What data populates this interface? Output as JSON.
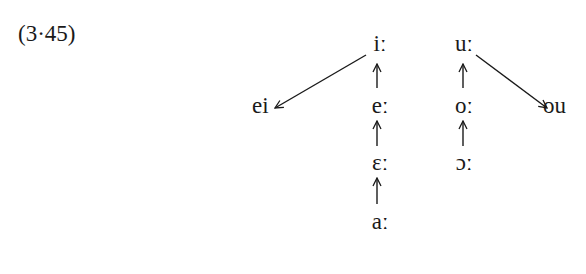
{
  "example_number": "(3·45)",
  "columns": {
    "front": [
      {
        "id": "i_long",
        "symbol": "iː"
      },
      {
        "id": "e_long",
        "symbol": "eː"
      },
      {
        "id": "open_e_long",
        "symbol": "ɛː"
      },
      {
        "id": "a_long",
        "symbol": "aː"
      }
    ],
    "back": [
      {
        "id": "u_long",
        "symbol": "uː"
      },
      {
        "id": "o_long",
        "symbol": "oː"
      },
      {
        "id": "open_o_long",
        "symbol": "ɔː"
      }
    ]
  },
  "diphthongs": {
    "front": {
      "id": "ei",
      "symbol": "ei"
    },
    "back": {
      "id": "ou",
      "symbol": "ou"
    }
  },
  "arrows": [
    {
      "from": "a_long",
      "to": "open_e_long",
      "direction": "up"
    },
    {
      "from": "open_e_long",
      "to": "e_long",
      "direction": "up"
    },
    {
      "from": "e_long",
      "to": "i_long",
      "direction": "up"
    },
    {
      "from": "i_long",
      "to": "ei",
      "direction": "down-left"
    },
    {
      "from": "open_o_long",
      "to": "o_long",
      "direction": "up"
    },
    {
      "from": "o_long",
      "to": "u_long",
      "direction": "up"
    },
    {
      "from": "u_long",
      "to": "ou",
      "direction": "down-right"
    }
  ],
  "colors": {
    "ink": "#1a1a1a",
    "background": "#ffffff"
  }
}
